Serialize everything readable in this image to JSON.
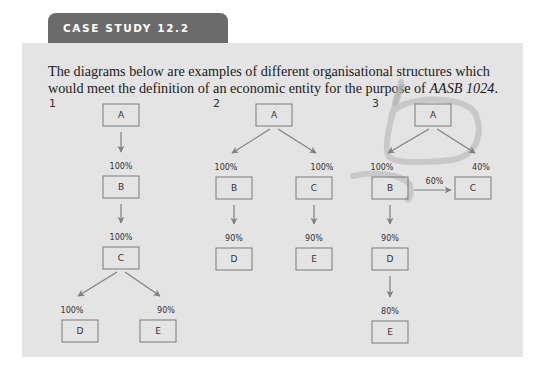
{
  "header": {
    "tab_label": "CASE STUDY 12.2"
  },
  "intro": {
    "text_before": "The diagrams below are examples of different organisational structures which would meet the definition of an economic entity for the purpose of ",
    "standard": "AASB 1024",
    "text_after": "."
  },
  "diagrams": [
    {
      "number": "1",
      "entities": [
        "A",
        "B",
        "C",
        "D",
        "E"
      ],
      "relations": [
        {
          "from": "A",
          "to": "B",
          "ownership": "100%"
        },
        {
          "from": "B",
          "to": "C",
          "ownership": "100%"
        },
        {
          "from": "C",
          "to": "D",
          "ownership": "100%"
        },
        {
          "from": "C",
          "to": "E",
          "ownership": "90%"
        }
      ]
    },
    {
      "number": "2",
      "entities": [
        "A",
        "B",
        "C",
        "D",
        "E"
      ],
      "relations": [
        {
          "from": "A",
          "to": "B",
          "ownership": "100%"
        },
        {
          "from": "A",
          "to": "C",
          "ownership": "100%"
        },
        {
          "from": "B",
          "to": "D",
          "ownership": "90%"
        },
        {
          "from": "C",
          "to": "E",
          "ownership": "90%"
        }
      ]
    },
    {
      "number": "3",
      "entities": [
        "A",
        "B",
        "C",
        "D",
        "E"
      ],
      "relations": [
        {
          "from": "A",
          "to": "B",
          "ownership": "100%"
        },
        {
          "from": "A",
          "to": "C",
          "ownership": "40%"
        },
        {
          "from": "B",
          "to": "C",
          "ownership": "60%"
        },
        {
          "from": "B",
          "to": "D",
          "ownership": "90%"
        },
        {
          "from": "D",
          "to": "E",
          "ownership": "80%"
        }
      ],
      "annotation": "hand-drawn circle around A"
    }
  ]
}
